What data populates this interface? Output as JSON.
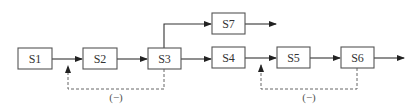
{
  "diagram": {
    "type": "block-flow",
    "colors": {
      "line": "#333333",
      "box_border": "#555555",
      "box_fill": "#ffffff",
      "dashed": "#666666"
    },
    "blocks": [
      {
        "id": "S1",
        "label": "S1"
      },
      {
        "id": "S2",
        "label": "S2"
      },
      {
        "id": "S3",
        "label": "S3"
      },
      {
        "id": "S4",
        "label": "S4"
      },
      {
        "id": "S5",
        "label": "S5"
      },
      {
        "id": "S6",
        "label": "S6"
      },
      {
        "id": "S7",
        "label": "S7"
      }
    ],
    "edges": [
      {
        "from": "S1",
        "to": "S2",
        "style": "solid"
      },
      {
        "from": "S2",
        "to": "S3",
        "style": "solid"
      },
      {
        "from": "S3",
        "to": "S4",
        "style": "solid"
      },
      {
        "from": "S3",
        "to": "S7",
        "style": "solid"
      },
      {
        "from": "S4",
        "to": "S5",
        "style": "solid"
      },
      {
        "from": "S5",
        "to": "S6",
        "style": "solid"
      },
      {
        "from": "S6",
        "to": "output",
        "style": "solid"
      },
      {
        "from": "S7",
        "to": "output",
        "style": "solid"
      }
    ],
    "feedback": [
      {
        "from": "S3",
        "to": "S1-S2 link",
        "style": "dashed",
        "sign": "(−)"
      },
      {
        "from": "S6",
        "to": "S4-S5 link",
        "style": "dashed",
        "sign": "(−)"
      }
    ]
  }
}
